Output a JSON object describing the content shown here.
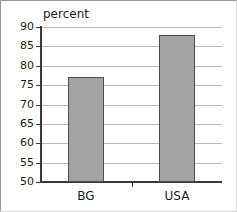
{
  "chart_data": {
    "type": "bar",
    "title": "",
    "subtitle": "",
    "xlabel": "",
    "ylabel": "percent",
    "categories": [
      "BG",
      "USA"
    ],
    "values": [
      77,
      88
    ],
    "series": [
      {
        "name": "percent",
        "values": [
          77,
          88
        ]
      }
    ],
    "ylim": [
      50,
      90
    ],
    "yticks": [
      50,
      55,
      60,
      65,
      70,
      75,
      80,
      85,
      90
    ],
    "ytick_labels": [
      "50",
      "55",
      "60",
      "65",
      "70",
      "75",
      "80",
      "85",
      "90"
    ],
    "grid": true,
    "grid_axis": "y",
    "legend": false,
    "legend_position": "none",
    "bar_color": "#a3a3a3",
    "bar_edge_color": "#4d4d4d",
    "axis_color": "#3a3a3a",
    "gridline_color": "#b9b9b9",
    "annotations": []
  }
}
